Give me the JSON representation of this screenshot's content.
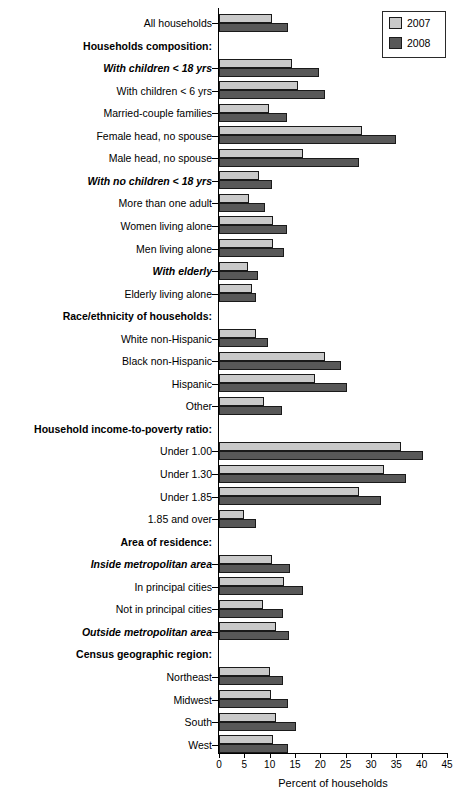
{
  "chart_data": {
    "type": "bar",
    "orientation": "horizontal",
    "title": "",
    "xlabel": "Percent of households",
    "ylabel": "",
    "xlim": [
      0,
      45
    ],
    "xticks": [
      0,
      5,
      10,
      15,
      20,
      25,
      30,
      35,
      40,
      45
    ],
    "grid": false,
    "legend": {
      "position": "top-right",
      "entries": [
        {
          "name": "2007",
          "color": "#c9c9c9"
        },
        {
          "name": "2008",
          "color": "#585858"
        }
      ]
    },
    "series": [
      {
        "name": "2007",
        "color": "#c9c9c9"
      },
      {
        "name": "2008",
        "color": "#585858"
      }
    ],
    "rows": [
      {
        "label": "All households",
        "style": "normal",
        "values": [
          10.4,
          13.6
        ]
      },
      {
        "label": "Households composition:",
        "style": "bold",
        "values": [
          null,
          null
        ]
      },
      {
        "label": "With children < 18 yrs",
        "style": "bolditalic",
        "values": [
          14.5,
          19.7
        ]
      },
      {
        "label": "With children < 6 yrs",
        "style": "normal",
        "values": [
          15.6,
          20.9
        ]
      },
      {
        "label": "Married-couple families",
        "style": "normal",
        "values": [
          9.9,
          13.5
        ]
      },
      {
        "label": "Female head, no spouse",
        "style": "normal",
        "values": [
          28.3,
          35.0
        ]
      },
      {
        "label": "Male head, no spouse",
        "style": "normal",
        "values": [
          16.5,
          27.6
        ]
      },
      {
        "label": "With no children < 18 yrs",
        "style": "bolditalic",
        "values": [
          7.9,
          10.4
        ]
      },
      {
        "label": "More than one adult",
        "style": "normal",
        "values": [
          6.0,
          9.1
        ]
      },
      {
        "label": "Women living alone",
        "style": "normal",
        "values": [
          10.7,
          13.5
        ]
      },
      {
        "label": "Men living alone",
        "style": "normal",
        "values": [
          10.6,
          12.8
        ]
      },
      {
        "label": "With elderly",
        "style": "bolditalic",
        "values": [
          5.7,
          7.6
        ]
      },
      {
        "label": "Elderly living alone",
        "style": "normal",
        "values": [
          6.6,
          7.4
        ]
      },
      {
        "label": "Race/ethnicity of households:",
        "style": "bold",
        "values": [
          null,
          null
        ]
      },
      {
        "label": "White non-Hispanic",
        "style": "normal",
        "values": [
          7.3,
          9.7
        ]
      },
      {
        "label": "Black non-Hispanic",
        "style": "normal",
        "values": [
          20.9,
          24.0
        ]
      },
      {
        "label": "Hispanic",
        "style": "normal",
        "values": [
          18.9,
          25.3
        ]
      },
      {
        "label": "Other",
        "style": "normal",
        "values": [
          8.9,
          12.4
        ]
      },
      {
        "label": "Household income-to-poverty ratio:",
        "style": "bold",
        "values": [
          null,
          null
        ]
      },
      {
        "label": "Under 1.00",
        "style": "normal",
        "values": [
          36.0,
          40.3
        ]
      },
      {
        "label": "Under 1.30",
        "style": "normal",
        "values": [
          32.6,
          36.9
        ]
      },
      {
        "label": "Under 1.85",
        "style": "normal",
        "values": [
          27.6,
          32.0
        ]
      },
      {
        "label": "1.85 and over",
        "style": "normal",
        "values": [
          5.0,
          7.4
        ]
      },
      {
        "label": "Area of residence:",
        "style": "bold",
        "values": [
          null,
          null
        ]
      },
      {
        "label": "Inside metropolitan area",
        "style": "bolditalic",
        "values": [
          10.4,
          14.1
        ]
      },
      {
        "label": "In principal cities",
        "style": "normal",
        "values": [
          12.8,
          16.6
        ]
      },
      {
        "label": "Not in principal cities",
        "style": "normal",
        "values": [
          8.7,
          12.6
        ]
      },
      {
        "label": "Outside metropolitan area",
        "style": "bolditalic",
        "values": [
          11.2,
          13.8
        ]
      },
      {
        "label": "Census geographic region:",
        "style": "bold",
        "values": [
          null,
          null
        ]
      },
      {
        "label": "Northeast",
        "style": "normal",
        "values": [
          10.1,
          12.6
        ]
      },
      {
        "label": "Midwest",
        "style": "normal",
        "values": [
          10.2,
          13.6
        ]
      },
      {
        "label": "South",
        "style": "normal",
        "values": [
          11.2,
          15.2
        ]
      },
      {
        "label": "West",
        "style": "normal",
        "values": [
          10.7,
          13.7
        ]
      }
    ]
  }
}
